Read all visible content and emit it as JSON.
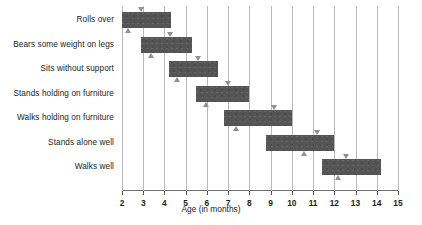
{
  "chart_data": {
    "type": "bar",
    "orientation": "horizontal",
    "title": "",
    "xlabel": "Age (in months)",
    "ylabel": "",
    "xlim": [
      2,
      15
    ],
    "ylim": [
      0,
      7
    ],
    "grid": true,
    "legend": null,
    "xticks": [
      2,
      3,
      4,
      5,
      6,
      7,
      8,
      9,
      10,
      11,
      12,
      13,
      14,
      15
    ],
    "xtick_labels": [
      "2",
      "3",
      "4",
      "5",
      "6",
      "7",
      "8",
      "9",
      "10",
      "11",
      "12",
      "13",
      "14",
      "15"
    ],
    "categories": [
      "Rolls over",
      "Bears some weight on legs",
      "Sits without support",
      "Stands holding on furniture",
      "Walks holding on furniture",
      "Stands alone well",
      "Walks well"
    ],
    "series": [
      {
        "name": "Age window (months)",
        "bars": [
          {
            "category": "Rolls over",
            "start": 2.0,
            "end": 4.3,
            "marker_down": 2.9,
            "marker_up": 2.3
          },
          {
            "category": "Bears some weight on legs",
            "start": 2.9,
            "end": 5.3,
            "marker_down": 4.3,
            "marker_up": 3.4
          },
          {
            "category": "Sits without support",
            "start": 4.2,
            "end": 6.5,
            "marker_down": 5.6,
            "marker_up": 4.6
          },
          {
            "category": "Stands holding on furniture",
            "start": 5.5,
            "end": 8.0,
            "marker_down": 7.0,
            "marker_up": 6.0
          },
          {
            "category": "Walks holding on furniture",
            "start": 6.8,
            "end": 10.0,
            "marker_down": 9.2,
            "marker_up": 7.4
          },
          {
            "category": "Stands alone well",
            "start": 8.8,
            "end": 12.0,
            "marker_down": 11.2,
            "marker_up": 10.6
          },
          {
            "category": "Walks well",
            "start": 11.4,
            "end": 14.2,
            "marker_down": 12.6,
            "marker_up": 12.2
          }
        ]
      }
    ],
    "colors": {
      "bar_fill": "#555555",
      "gridline": "#b9b9b9",
      "marker": "#8f8f8f",
      "text": "#1c1c1c",
      "background": "#ffffff"
    },
    "marker_legend": {
      "down_triangle": "upper percentile marker",
      "up_triangle": "lower percentile marker"
    }
  }
}
